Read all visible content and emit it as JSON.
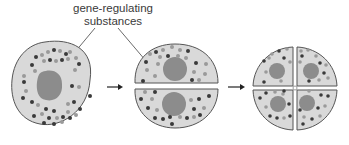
{
  "diagram": {
    "label": {
      "line1": "gene-regulating",
      "line2": "substances"
    },
    "stages": [
      {
        "name": "one-cell",
        "cells": 1
      },
      {
        "name": "two-cell",
        "cells": 2
      },
      {
        "name": "four-cell",
        "cells": 4
      }
    ],
    "colors": {
      "cytoplasm": "#d9d9d9",
      "nucleus": "#8c8c8c",
      "outline": "#555555",
      "dark_dot": "#3a3a3a",
      "light_dot": "#9a9a9a",
      "arrow": "#222222"
    }
  }
}
